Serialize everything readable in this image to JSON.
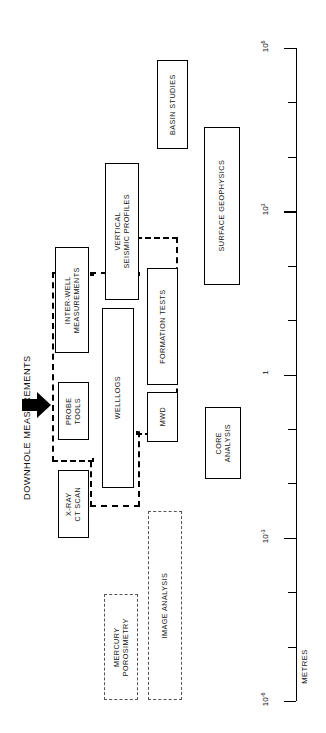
{
  "diagram": {
    "title": "DOWNHOLE MEASUREMENTS",
    "axis_title": "METRES",
    "orientation": "rotated-90-ccw",
    "arrow_icon": "black-right-arrow"
  },
  "axis": {
    "labels": [
      {
        "mantissa": "10",
        "exponent": "6",
        "text": "10 6"
      },
      {
        "mantissa": "10",
        "exponent": "3",
        "text": "10 3"
      },
      {
        "mantissa": "1",
        "exponent": "",
        "text": "1"
      },
      {
        "mantissa": "10",
        "exponent": "-3",
        "text": "10 -3"
      },
      {
        "mantissa": "10",
        "exponent": "-6",
        "text": "10 -6"
      }
    ],
    "tick_count": 13,
    "unit": "METRES"
  },
  "boxes": [
    {
      "id": "basin-studies",
      "label": "BASIN STUDIES",
      "style": "solid"
    },
    {
      "id": "surface-geophysics",
      "label": "SURFACE GEOPHYSICS",
      "style": "solid"
    },
    {
      "id": "vertical-seismic",
      "label": "VERTICAL\nSEISMIC PROFILES",
      "line1": "VERTICAL",
      "line2": "SEISMIC PROFILES",
      "style": "solid"
    },
    {
      "id": "inter-well",
      "label": "INTER-WELL\nMEASUREMENTS",
      "line1": "INTER-WELL",
      "line2": "MEASUREMENTS",
      "style": "solid"
    },
    {
      "id": "probe-tools",
      "label": "PROBE\nTOOLS",
      "line1": "PROBE",
      "line2": "TOOLS",
      "style": "solid"
    },
    {
      "id": "well-logs",
      "label": "WELLLOGS",
      "style": "solid"
    },
    {
      "id": "formation-tests",
      "label": "FORMATION  TESTS",
      "style": "solid"
    },
    {
      "id": "mwd",
      "label": "MWD",
      "style": "solid"
    },
    {
      "id": "x-ray-ct-scan",
      "label": "X-RAY\nCT SCAN",
      "line1": "X-RAY",
      "line2": "CT SCAN",
      "style": "solid"
    },
    {
      "id": "core-analysis",
      "label": "CORE\nANALYSIS",
      "line1": "CORE",
      "line2": "ANALYSIS",
      "style": "solid"
    },
    {
      "id": "image-analysis",
      "label": "IMAGE ANALYSIS",
      "style": "dashed"
    },
    {
      "id": "mercury-porosimetry",
      "label": "MERCURY\nPOROSIMETRY",
      "line1": "MERCURY",
      "line2": "POROSIMETRY",
      "style": "dashed"
    }
  ],
  "colors": {
    "ink": "#000000",
    "paper": "#ffffff",
    "dash": "#555555"
  }
}
